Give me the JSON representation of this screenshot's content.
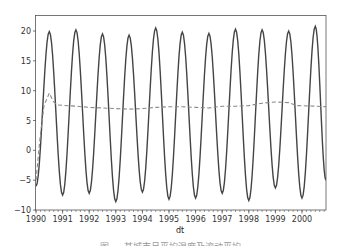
{
  "chart_data": {
    "type": "line",
    "title": "",
    "xlabel": "dt",
    "ylabel": "",
    "xlim": [
      1990.0,
      2000.9
    ],
    "ylim": [
      -10,
      22
    ],
    "x_ticks": [
      "1990",
      "1991",
      "1992",
      "1993",
      "1994",
      "1995",
      "1996",
      "1997",
      "1998",
      "1999",
      "2000"
    ],
    "y_ticks": [
      "-10",
      "-5",
      "0",
      "5",
      "10",
      "15",
      "20"
    ],
    "grid": false,
    "legend": null,
    "series": [
      {
        "name": "temperature",
        "style": "solid",
        "color": "#444444",
        "points": [
          [
            1990.0,
            -6.0
          ],
          [
            1990.5,
            19.9
          ],
          [
            1991.0,
            -7.5
          ],
          [
            1991.5,
            20.2
          ],
          [
            1992.0,
            -7.2
          ],
          [
            1992.5,
            19.5
          ],
          [
            1993.0,
            -8.6
          ],
          [
            1993.5,
            19.3
          ],
          [
            1994.0,
            -7.0
          ],
          [
            1994.5,
            20.5
          ],
          [
            1995.0,
            -8.2
          ],
          [
            1995.5,
            19.8
          ],
          [
            1996.0,
            -8.0
          ],
          [
            1996.5,
            19.6
          ],
          [
            1997.0,
            -7.2
          ],
          [
            1997.5,
            20.3
          ],
          [
            1998.0,
            -8.4
          ],
          [
            1998.5,
            20.2
          ],
          [
            1999.0,
            -6.3
          ],
          [
            1999.5,
            20.0
          ],
          [
            2000.0,
            -8.0
          ],
          [
            2000.5,
            20.8
          ],
          [
            2000.9,
            -5.0
          ]
        ]
      },
      {
        "name": "rolling mean",
        "style": "dashed",
        "color": "#888888",
        "points": [
          [
            1990.0,
            -5.0
          ],
          [
            1990.15,
            2.0
          ],
          [
            1990.3,
            7.5
          ],
          [
            1990.5,
            9.6
          ],
          [
            1990.65,
            8.2
          ],
          [
            1990.8,
            7.6
          ],
          [
            1991.5,
            7.4
          ],
          [
            1992.0,
            7.2
          ],
          [
            1992.5,
            7.1
          ],
          [
            1993.0,
            7.0
          ],
          [
            1993.5,
            6.9
          ],
          [
            1994.0,
            7.0
          ],
          [
            1994.5,
            7.2
          ],
          [
            1995.0,
            7.3
          ],
          [
            1995.5,
            7.3
          ],
          [
            1996.0,
            7.2
          ],
          [
            1996.5,
            7.1
          ],
          [
            1997.0,
            7.4
          ],
          [
            1997.5,
            7.4
          ],
          [
            1998.0,
            7.5
          ],
          [
            1998.5,
            7.9
          ],
          [
            1999.0,
            8.1
          ],
          [
            1999.5,
            8.0
          ],
          [
            1999.8,
            7.5
          ],
          [
            2000.5,
            7.4
          ],
          [
            2000.9,
            7.3
          ]
        ]
      }
    ]
  },
  "caption": "图 ... 某城市月平均温度及滚动平均"
}
